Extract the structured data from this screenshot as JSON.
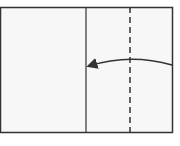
{
  "diagram": {
    "type": "origami-fold-step",
    "paper": {
      "x": 0,
      "y": 7,
      "width": 173,
      "height": 126,
      "fill": "#f7f7f7",
      "stroke": "#333333"
    },
    "crease_line": {
      "x": 86,
      "style": "solid"
    },
    "fold_line": {
      "x": 130,
      "style": "dashed"
    },
    "arrow": {
      "from": [
        172,
        65
      ],
      "to": [
        89,
        66
      ],
      "direction": "left",
      "meaning": "fold right edge to crease"
    },
    "colors": {
      "line": "#333333",
      "paper": "#f7f7f7",
      "background": "#ffffff"
    }
  }
}
